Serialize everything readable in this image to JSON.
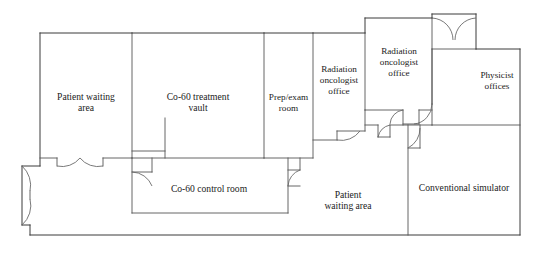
{
  "diagram": {
    "type": "architectural-floor-plan",
    "stroke_color": "#3a3a3a",
    "background_color": "#ffffff",
    "width": 540,
    "height": 273
  },
  "rooms": [
    {
      "id": "patient-waiting-area-left",
      "label": "Patient waiting\narea",
      "label_x": 86,
      "label_y": 103,
      "font_size": 9.6
    },
    {
      "id": "co60-treatment-vault",
      "label": "Co-60 treatment\nvault",
      "label_x": 198,
      "label_y": 103,
      "font_size": 9.6
    },
    {
      "id": "prep-exam-room",
      "label": "Prep/exam\nroom",
      "label_x": 288,
      "label_y": 104,
      "font_size": 9.2
    },
    {
      "id": "radiation-oncologist-office-1",
      "label": "Radiation\noncologist\noffice",
      "label_x": 339,
      "label_y": 82,
      "font_size": 9.2
    },
    {
      "id": "radiation-oncologist-office-2",
      "label": "Radiation\noncologist\noffice",
      "label_x": 399,
      "label_y": 64,
      "font_size": 9.2
    },
    {
      "id": "physicist-offices",
      "label": "Physicist\noffices",
      "label_x": 497,
      "label_y": 88,
      "font_size": 9.2
    },
    {
      "id": "co60-control-room",
      "label": "Co-60 control room",
      "label_x": 209,
      "label_y": 189,
      "font_size": 9.6
    },
    {
      "id": "patient-waiting-area-lower",
      "label": "Patient\nwaiting area",
      "label_x": 348,
      "label_y": 201,
      "font_size": 9.6
    },
    {
      "id": "conventional-simulator",
      "label": "Conventional simulator",
      "label_x": 464,
      "label_y": 188,
      "font_size": 9.6
    }
  ]
}
